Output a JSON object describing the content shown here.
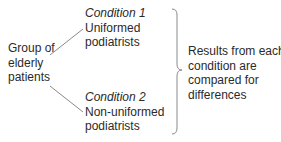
{
  "diagram": {
    "type": "experimental-design",
    "source": {
      "lines": [
        "Group of",
        "elderly",
        "patients"
      ]
    },
    "conditions": [
      {
        "label": "Condition 1",
        "description_lines": [
          "Uniformed",
          "podiatrists"
        ]
      },
      {
        "label": "Condition 2",
        "description_lines": [
          "Non-uniformed",
          "podiatrists"
        ]
      }
    ],
    "outcome": {
      "lines": [
        "Results from each",
        "condition are",
        "compared for",
        "differences"
      ]
    },
    "colors": {
      "text": "#2a2a2a",
      "lines": "#8a8a8a"
    }
  }
}
